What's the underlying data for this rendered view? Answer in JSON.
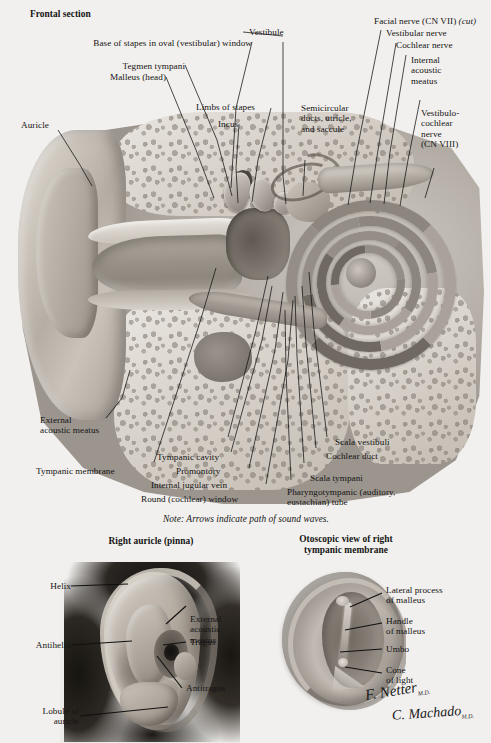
{
  "figure": {
    "main_title": "Frontal section",
    "note": "Note: Arrows indicate path of sound waves.",
    "signature_1": "F. Netter",
    "signature_1_suffix": "M.D.",
    "signature_2": "C. Machado",
    "signature_2_suffix": "M.D."
  },
  "main_labels": {
    "vestibule": "Vestibule",
    "base_of_stapes": "Base of stapes in oval (vestibular) window",
    "tegmen_tympani": "Tegmen tympani",
    "malleus_head": "Malleus (head)",
    "limbs_of_stapes": "Limbs of stapes",
    "incus": "Incus",
    "auricle": "Auricle",
    "semicircular": "Semicircular\nducts, utricle,\nand saccule",
    "facial_nerve": "Facial nerve (CN VII) ",
    "facial_nerve_cut": "(cut)",
    "vestibular_nerve": "Vestibular nerve",
    "cochlear_nerve": "Cochlear nerve",
    "internal_acoustic_meatus": "Internal\nacoustic\nmeatus",
    "vestibulocochlear_nerve": "Vestibulo-\ncochlear\nnerve\n(CN VIII)",
    "external_acoustic_meatus": "External\nacoustic meatus",
    "tympanic_membrane": "Tympanic membrane",
    "tympanic_cavity": "Tympanic cavity",
    "promontory": "Promontory",
    "internal_jugular_vein": "Internal jugular vein",
    "round_window": "Round (cochlear) window",
    "scala_vestibuli": "Scala vestibuli",
    "cochlear_duct": "Cochlear duct",
    "scala_tympani": "Scala tympani",
    "pharyngotympanic_tube": "Pharyngotympanic (auditory,\neustachian) tube"
  },
  "auricle_panel": {
    "title": "Right auricle (pinna)",
    "helix": "Helix",
    "antihelix": "Antihelix",
    "lobule": "Lobule of\nauricle",
    "external_acoustic_meatus": "External\nacoustic\nmeatus",
    "tragus": "Tragus",
    "antitragus": "Antitragus"
  },
  "otoscopic_panel": {
    "title": "Otoscopic view of right\ntympanic membrane",
    "lateral_process": "Lateral process\nof malleus",
    "handle_of_malleus": "Handle\nof malleus",
    "umbo": "Umbo",
    "cone_of_light": "Cone\nof light"
  },
  "colors": {
    "paper": "#f2f0ee",
    "ink": "#141414"
  }
}
